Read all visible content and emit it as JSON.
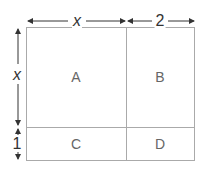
{
  "diagram": {
    "dimensions": {
      "top_left": "x",
      "top_right": "2",
      "left_top": "x",
      "left_bottom": "1"
    },
    "regions": [
      {
        "id": "A",
        "label": "A"
      },
      {
        "id": "B",
        "label": "B"
      },
      {
        "id": "C",
        "label": "C"
      },
      {
        "id": "D",
        "label": "D"
      }
    ],
    "colors": {
      "line": "#999999",
      "arrow": "#333333",
      "text": "#666666"
    }
  }
}
